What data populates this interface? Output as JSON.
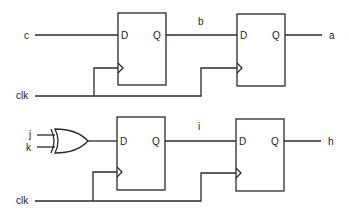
{
  "diagram": {
    "type": "sequential-logic-circuit",
    "colors": {
      "background": "#ffffff",
      "line": "#2a2a2a",
      "text": "#222222"
    },
    "top_circuit": {
      "inputs": {
        "data": "c",
        "clock": "clk"
      },
      "intermediate_signal": "b",
      "output": "a",
      "flip_flops": [
        {
          "id": "ff1",
          "d_label": "D",
          "q_label": "Q"
        },
        {
          "id": "ff2",
          "d_label": "D",
          "q_label": "Q"
        }
      ]
    },
    "bottom_circuit": {
      "inputs": {
        "xor_in_1": "j",
        "xor_in_2": "k",
        "clock": "clk"
      },
      "gate": "XOR",
      "intermediate_signal": "i",
      "output": "h",
      "flip_flops": [
        {
          "id": "ff3",
          "d_label": "D",
          "q_label": "Q"
        },
        {
          "id": "ff4",
          "d_label": "D",
          "q_label": "Q"
        }
      ]
    }
  }
}
